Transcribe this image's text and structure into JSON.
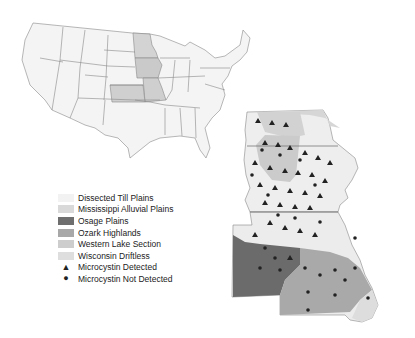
{
  "legend": {
    "regions": [
      {
        "label": "Dissected Till Plains",
        "color": "#f2f2f2"
      },
      {
        "label": "Mississippi Alluvial Plains",
        "color": "#d9d9d9"
      },
      {
        "label": "Osage Plains",
        "color": "#6e6e6e"
      },
      {
        "label": "Ozark Highlands",
        "color": "#a8a8a8"
      },
      {
        "label": "Western Lake Section",
        "color": "#cdcdcd"
      },
      {
        "label": "Wisconsin Driftless",
        "color": "#dedede"
      }
    ],
    "markers": [
      {
        "label": "Microcystin Detected",
        "symbol": "triangle",
        "glyph": "▲"
      },
      {
        "label": "Microcystin Not Detected",
        "symbol": "circle",
        "glyph": "●"
      }
    ]
  },
  "maps": {
    "overview": "Contiguous United States with Minnesota, Iowa, Missouri, Kansas highlighted",
    "detail": "Iowa and Missouri sampling sites by ecoregion"
  }
}
